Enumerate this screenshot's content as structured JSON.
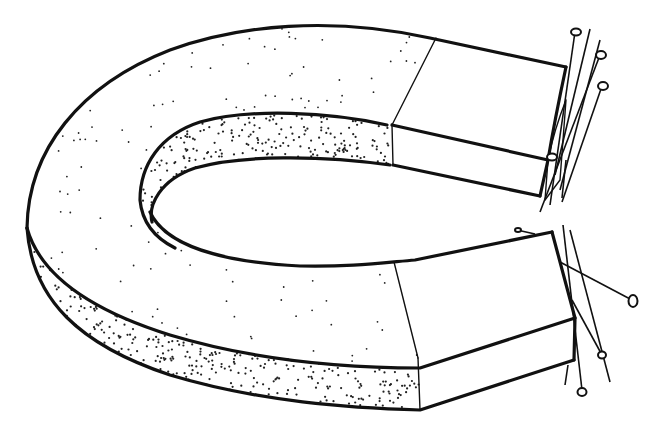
{
  "illustration": {
    "title": "Horseshoe magnet attracting pins",
    "subject": "horseshoe-magnet",
    "style": "black ink line drawing with stipple shading",
    "colors": {
      "ink": "#111111",
      "paper": "#ffffff"
    },
    "parts": [
      {
        "name": "magnet-body",
        "description": "U-shaped horseshoe magnet body, top face lightly stippled"
      },
      {
        "name": "magnet-side-strip",
        "description": "curved outer side face, densely stippled"
      },
      {
        "name": "inner-slot-strip",
        "description": "inner curved face, densely stippled"
      },
      {
        "name": "pole-top",
        "description": "upper pole end, unshaded"
      },
      {
        "name": "pole-bottom",
        "description": "lower pole end, unshaded"
      }
    ],
    "pins": {
      "top_pole_count": 6,
      "bottom_pole_count": 6
    }
  }
}
